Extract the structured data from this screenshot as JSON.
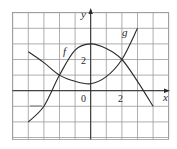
{
  "chart_data": {
    "type": "line",
    "title": "",
    "xlabel": "x",
    "ylabel": "y",
    "xlim": [
      -5,
      5
    ],
    "ylim": [
      -3.2,
      5
    ],
    "grid": true,
    "tick_labels": {
      "x": [
        "0",
        "2"
      ],
      "y": [
        "2"
      ]
    },
    "series": [
      {
        "name": "f",
        "x": [
          -4,
          -3,
          -2,
          -1,
          0,
          1,
          2,
          3,
          4
        ],
        "values": [
          -2,
          -1,
          1,
          2.6,
          3,
          2.7,
          2,
          0.6,
          -1
        ]
      },
      {
        "name": "g",
        "x": [
          -4,
          -3,
          -2,
          -1,
          0,
          1,
          2,
          3
        ],
        "values": [
          2.5,
          1.8,
          1,
          0.6,
          0.45,
          0.9,
          2,
          4
        ]
      }
    ],
    "annotations": [
      {
        "text": "f",
        "x": -1.6,
        "y": 2.4
      },
      {
        "text": "g",
        "x": 2.2,
        "y": 3.6
      }
    ]
  },
  "labels": {
    "x_axis": "x",
    "y_axis": "y",
    "origin": "0",
    "x_tick_2": "2",
    "y_tick_2": "2",
    "f_label": "f",
    "g_label": "g"
  }
}
